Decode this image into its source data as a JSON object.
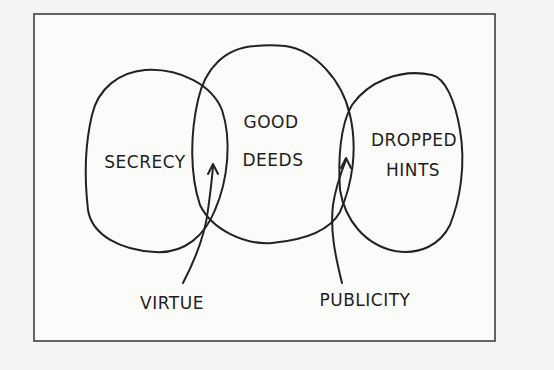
{
  "diagram": {
    "type": "venn",
    "sets": [
      {
        "id": "left",
        "label": "SECRECY"
      },
      {
        "id": "middle",
        "label_line1": "GOOD",
        "label_line2": "DEEDS"
      },
      {
        "id": "right",
        "label_line1": "DROPPED",
        "label_line2": "HINTS"
      }
    ],
    "annotations": [
      {
        "label": "VIRTUE",
        "points_to": "intersection of SECRECY and GOOD DEEDS"
      },
      {
        "label": "PUBLICITY",
        "points_to": "intersection of GOOD DEEDS and DROPPED HINTS"
      }
    ],
    "colors": {
      "background": "#f4f4f2",
      "ink": "#222222",
      "panel": "#fbfbfa"
    }
  }
}
